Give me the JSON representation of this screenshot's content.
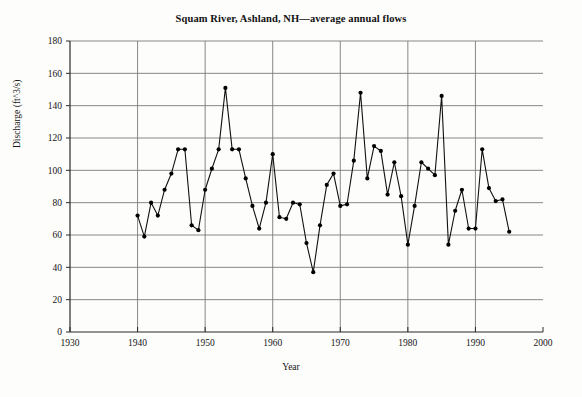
{
  "chart_data": {
    "type": "line",
    "title": "Squam River, Ashland, NH—average annual flows",
    "xlabel": "Year",
    "ylabel": "Discharge (ft^3/s)",
    "xlim": [
      1930,
      2000
    ],
    "ylim": [
      0,
      180
    ],
    "xticks": [
      1930,
      1940,
      1950,
      1960,
      1970,
      1980,
      1990,
      2000
    ],
    "yticks": [
      0,
      20,
      40,
      60,
      80,
      100,
      120,
      140,
      160,
      180
    ],
    "grid": true,
    "legend": "none",
    "marker": "filled-circle",
    "line_color": "#111111",
    "marker_color": "#000000",
    "grid_color": "#7a7a7a",
    "series": [
      {
        "name": "Average annual flow",
        "x": [
          1940,
          1941,
          1942,
          1943,
          1944,
          1945,
          1946,
          1947,
          1948,
          1949,
          1950,
          1951,
          1952,
          1953,
          1954,
          1955,
          1956,
          1957,
          1958,
          1959,
          1960,
          1961,
          1962,
          1963,
          1964,
          1965,
          1966,
          1967,
          1968,
          1969,
          1970,
          1971,
          1972,
          1973,
          1974,
          1975,
          1976,
          1977,
          1978,
          1979,
          1980,
          1981,
          1982,
          1983,
          1984,
          1985,
          1986,
          1987,
          1988,
          1989,
          1990,
          1991,
          1992,
          1993,
          1994,
          1995
        ],
        "values": [
          72,
          59,
          80,
          72,
          88,
          98,
          113,
          113,
          66,
          63,
          88,
          101,
          113,
          151,
          113,
          113,
          95,
          78,
          64,
          80,
          110,
          71,
          70,
          80,
          79,
          55,
          37,
          66,
          91,
          98,
          78,
          79,
          106,
          148,
          95,
          115,
          112,
          85,
          105,
          84,
          54,
          78,
          105,
          101,
          97,
          146,
          54,
          75,
          88,
          64,
          64,
          113,
          89,
          81,
          82,
          62
        ]
      }
    ]
  },
  "axis": {
    "y_tick_labels": [
      "180",
      "160",
      "140",
      "120",
      "100",
      "80",
      "60",
      "40",
      "20",
      "0"
    ],
    "x_tick_labels": [
      "1930",
      "1940",
      "1950",
      "1960",
      "1970",
      "1980",
      "1990",
      "2000"
    ]
  }
}
